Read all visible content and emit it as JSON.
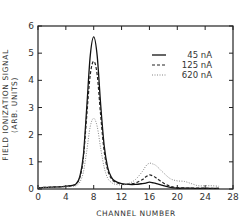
{
  "chart_data": {
    "type": "line",
    "title": "",
    "xlabel": "CHANNEL NUMBER",
    "ylabel_line1": "FIELD IONIZATION SIGNAL",
    "ylabel_line2": "(ARB. UNITS)",
    "xlim": [
      0,
      28
    ],
    "ylim": [
      0,
      6
    ],
    "xticks": [
      0,
      4,
      8,
      12,
      16,
      20,
      24,
      28
    ],
    "yticks": [
      0,
      1,
      2,
      3,
      4,
      5,
      6
    ],
    "grid": false,
    "legend_position": "upper right",
    "x": [
      0,
      2,
      4,
      5,
      5.5,
      6,
      6.5,
      7,
      7.5,
      8,
      8.5,
      9,
      9.5,
      10,
      10.5,
      11,
      12,
      13,
      14,
      15,
      15.5,
      16,
      16.5,
      17,
      18,
      19,
      20,
      21,
      22,
      23,
      24,
      25,
      26
    ],
    "series": [
      {
        "name": "45 nA",
        "style": "solid",
        "values": [
          0.05,
          0.07,
          0.1,
          0.13,
          0.2,
          0.45,
          1.2,
          3.0,
          4.9,
          5.6,
          4.9,
          3.1,
          1.6,
          0.8,
          0.45,
          0.3,
          0.2,
          0.17,
          0.17,
          0.2,
          0.22,
          0.25,
          0.23,
          0.2,
          0.12,
          0.06,
          0.03,
          0.03,
          0.03,
          0.02,
          0.02,
          0.02,
          0.02
        ]
      },
      {
        "name": "125 nA",
        "style": "dashed",
        "values": [
          0.05,
          0.07,
          0.1,
          0.13,
          0.2,
          0.42,
          1.1,
          2.7,
          4.2,
          4.7,
          4.2,
          2.7,
          1.4,
          0.7,
          0.4,
          0.27,
          0.18,
          0.18,
          0.22,
          0.35,
          0.45,
          0.52,
          0.48,
          0.4,
          0.22,
          0.1,
          0.05,
          0.04,
          0.03,
          0.03,
          0.03,
          0.02,
          0.02
        ]
      },
      {
        "name": "620 nA",
        "style": "dotted",
        "values": [
          0.05,
          0.06,
          0.08,
          0.1,
          0.13,
          0.25,
          0.6,
          1.4,
          2.3,
          2.6,
          2.3,
          1.5,
          0.8,
          0.4,
          0.25,
          0.18,
          0.15,
          0.2,
          0.35,
          0.65,
          0.85,
          0.95,
          0.92,
          0.85,
          0.6,
          0.38,
          0.3,
          0.28,
          0.2,
          0.12,
          0.12,
          0.12,
          0.1
        ]
      }
    ]
  }
}
